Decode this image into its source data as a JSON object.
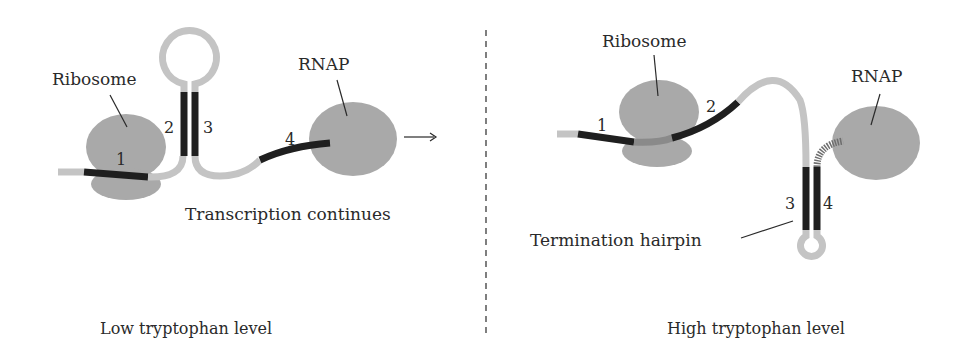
{
  "colors": {
    "body_gray": "#a9a9a9",
    "strand_light": "#c4c4c4",
    "segment_dark": "#1f1f1f",
    "line": "#2a2a2a"
  },
  "left_panel": {
    "caption": "Low tryptophan level",
    "ribosome_label": "Ribosome",
    "rnap_label": "RNAP",
    "status_text": "Transcription continues",
    "segments": [
      "1",
      "2",
      "3",
      "4"
    ],
    "arrow_icon": "right-arrow-icon"
  },
  "right_panel": {
    "caption": "High tryptophan level",
    "ribosome_label": "Ribosome",
    "rnap_label": "RNAP",
    "hairpin_label": "Termination hairpin",
    "segments": [
      "1",
      "2",
      "3",
      "4"
    ]
  },
  "divider": {
    "style": "dashed"
  }
}
